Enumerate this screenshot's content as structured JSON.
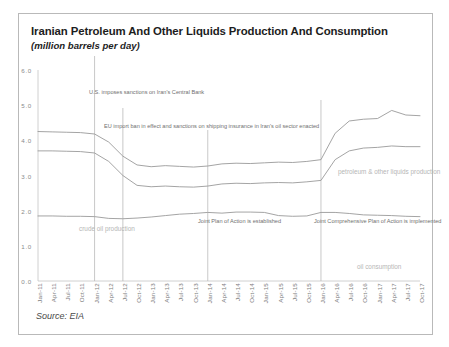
{
  "header": {
    "title": "Iranian Petroleum And Other Liquids Production And Consumption",
    "subtitle": "(million barrels per day)"
  },
  "source": {
    "text": "Source: EIA"
  },
  "annotations": {
    "us_sanctions": "U.S. imposes sanctions\non Iran's Central Bank",
    "eu_ban": "EU import ban in effect and sanctions on shipping\ninsurance in Iran's oil sector enacted",
    "jpoa": "Joint Plan of Action\nis established",
    "jcpoa": "Joint Comprehensive Plan\nof Action is implemented"
  },
  "series_labels": {
    "production": "petroleum & other liquids production",
    "crude": "crude oil\nproduction",
    "consumption": "oil consumption"
  },
  "colors": {
    "line": "#9a9a9a",
    "frame": "#b9b9b9",
    "axis_text": "#8a8a8a",
    "annotation_text": "#6f6f6f",
    "series_label": "#b6b6b6",
    "title": "#1d1d1d"
  },
  "chart_data": {
    "type": "line",
    "title": "Iranian Petroleum And Other Liquids Production And Consumption",
    "subtitle": "(million barrels per day)",
    "xlabel": "",
    "ylabel": "million barrels per day",
    "ylim": [
      0.0,
      6.0
    ],
    "yticks": [
      "0.0",
      "1.0",
      "2.0",
      "3.0",
      "4.0",
      "5.0",
      "6.0"
    ],
    "ytick_values": [
      0.0,
      1.0,
      2.0,
      3.0,
      4.0,
      5.0,
      6.0
    ],
    "grid": false,
    "legend_position": "inline-labels",
    "categories": [
      "Jan-11",
      "Apr-11",
      "Jul-11",
      "Oct-11",
      "Jan-12",
      "Apr-12",
      "Jul-12",
      "Oct-12",
      "Jan-13",
      "Apr-13",
      "Jul-13",
      "Oct-13",
      "Jan-14",
      "Apr-14",
      "Jul-14",
      "Oct-14",
      "Jan-15",
      "Apr-15",
      "Jul-15",
      "Oct-15",
      "Jan-16",
      "Apr-16",
      "Jul-16",
      "Oct-16",
      "Jan-17",
      "Apr-17",
      "Jul-17",
      "Oct-17"
    ],
    "series": [
      {
        "name": "petroleum & other liquids production",
        "values": [
          4.25,
          4.24,
          4.23,
          4.22,
          4.18,
          3.95,
          3.55,
          3.3,
          3.25,
          3.28,
          3.26,
          3.24,
          3.27,
          3.33,
          3.35,
          3.34,
          3.36,
          3.38,
          3.37,
          3.4,
          3.45,
          4.2,
          4.55,
          4.6,
          4.62,
          4.85,
          4.72,
          4.7
        ]
      },
      {
        "name": "crude oil production",
        "values": [
          3.7,
          3.7,
          3.69,
          3.68,
          3.64,
          3.4,
          3.0,
          2.72,
          2.68,
          2.7,
          2.68,
          2.67,
          2.7,
          2.76,
          2.78,
          2.77,
          2.79,
          2.8,
          2.79,
          2.82,
          2.86,
          3.45,
          3.7,
          3.78,
          3.8,
          3.84,
          3.82,
          3.82
        ]
      },
      {
        "name": "oil consumption",
        "values": [
          1.85,
          1.85,
          1.84,
          1.84,
          1.83,
          1.78,
          1.77,
          1.79,
          1.82,
          1.86,
          1.9,
          1.92,
          1.95,
          1.93,
          1.96,
          1.96,
          1.95,
          1.86,
          1.84,
          1.85,
          1.95,
          1.95,
          1.92,
          1.88,
          1.87,
          1.86,
          1.84,
          1.83
        ]
      }
    ],
    "event_markers": [
      {
        "label": "U.S. imposes sanctions on Iran's Central Bank",
        "x": "Jan-12"
      },
      {
        "label": "EU import ban in effect and sanctions on shipping insurance in Iran's oil sector enacted",
        "x": "Jul-12"
      },
      {
        "label": "Joint Plan of Action is established",
        "x": "Jan-14"
      },
      {
        "label": "Joint Comprehensive Plan of Action is implemented",
        "x": "Jan-16"
      }
    ]
  }
}
